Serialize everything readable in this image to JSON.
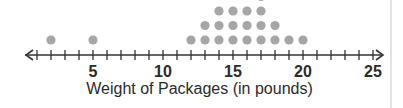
{
  "chart_data": {
    "type": "dot_plot",
    "title": "",
    "xlabel": "Weight of Packages (in pounds)",
    "ylabel": "",
    "xlim": [
      0,
      25
    ],
    "major_ticks": [
      5,
      10,
      15,
      20,
      25
    ],
    "minor_tick_step": 1,
    "tick_labels": [
      "5",
      "10",
      "15",
      "20",
      "25"
    ],
    "grid": false,
    "axis_arrows": "both",
    "dot_color": "#a6a6a6",
    "axis_color": "#333333",
    "points": [
      {
        "x": 2,
        "count": 1
      },
      {
        "x": 5,
        "count": 1
      },
      {
        "x": 12,
        "count": 1
      },
      {
        "x": 13,
        "count": 2
      },
      {
        "x": 14,
        "count": 3
      },
      {
        "x": 15,
        "count": 3
      },
      {
        "x": 16,
        "count": 3
      },
      {
        "x": 17,
        "count": 4
      },
      {
        "x": 18,
        "count": 2
      },
      {
        "x": 19,
        "count": 1
      },
      {
        "x": 20,
        "count": 1
      }
    ],
    "note": "Top of plot is cropped; the 4th dot above 17 is only partially visible."
  }
}
